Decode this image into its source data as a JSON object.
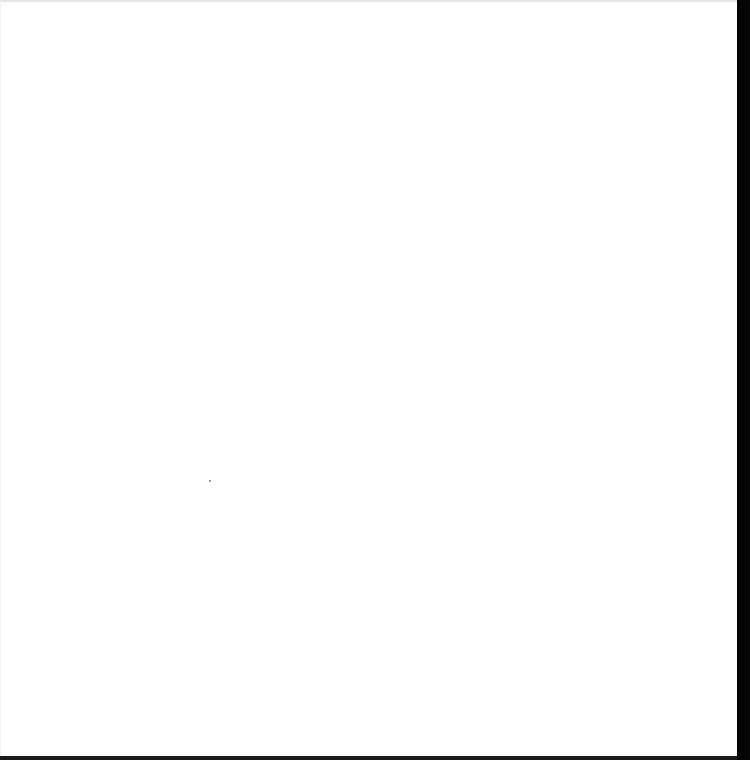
{
  "page": {
    "background_color": "#ffffff",
    "edge_color": "#050505",
    "content": ""
  }
}
